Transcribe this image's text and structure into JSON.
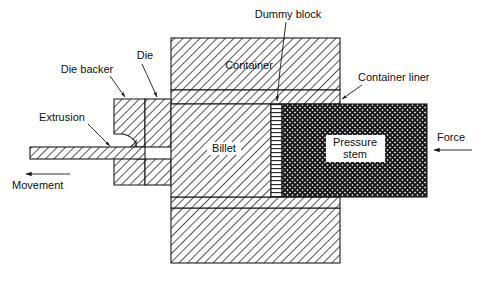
{
  "diagram": {
    "background_color": "#ffffff",
    "line_color": "#1a1a1a",
    "text_color": "#101010",
    "labels": {
      "dummy_block": "Dummy block",
      "container": "Container",
      "container_liner": "Container liner",
      "die": "Die",
      "die_backer": "Die backer",
      "extrusion": "Extrusion",
      "movement": "Movement",
      "billet": "Billet",
      "pressure_stem_line1": "Pressure",
      "pressure_stem_line2": "stem",
      "force": "Force"
    },
    "parts": [
      {
        "name": "extrusion-bar",
        "hatch": "diagonal-45",
        "label": "Extrusion"
      },
      {
        "name": "die-backer",
        "hatch": "diagonal-45",
        "label": "Die backer"
      },
      {
        "name": "die",
        "hatch": "diagonal-45",
        "label": "Die"
      },
      {
        "name": "container",
        "hatch": "diagonal-45",
        "label": "Container"
      },
      {
        "name": "container-liner",
        "hatch": "diagonal-45",
        "label": "Container liner"
      },
      {
        "name": "billet",
        "hatch": "diagonal-45",
        "label": "Billet"
      },
      {
        "name": "dummy-block",
        "hatch": "horizontal-lines",
        "label": "Dummy block"
      },
      {
        "name": "pressure-stem",
        "hatch": "cross-hatch",
        "label": "Pressure stem"
      }
    ],
    "arrows": [
      {
        "name": "movement-arrow",
        "direction": "left",
        "label": "Movement"
      },
      {
        "name": "force-arrow",
        "direction": "left",
        "label": "Force"
      }
    ]
  }
}
